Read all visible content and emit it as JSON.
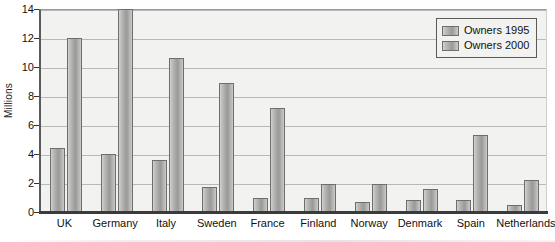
{
  "chart_data": {
    "type": "bar",
    "title": "",
    "xlabel": "",
    "ylabel": "Millions",
    "ylim": [
      0,
      14
    ],
    "yticks": [
      0,
      2,
      4,
      6,
      8,
      10,
      12,
      14
    ],
    "ytick_labels": [
      "0",
      "2",
      "4",
      "6",
      "8",
      "10",
      "12",
      "14"
    ],
    "grid": true,
    "legend_position": "top-right",
    "categories": [
      "UK",
      "Germany",
      "Italy",
      "Sweden",
      "France",
      "Finland",
      "Norway",
      "Denmark",
      "Spain",
      "Netherlands"
    ],
    "series": [
      {
        "name": "Owners 1995",
        "values": [
          4.4,
          4.0,
          3.6,
          1.7,
          1.0,
          1.0,
          0.7,
          0.8,
          0.8,
          0.5
        ]
      },
      {
        "name": "Owners 2000",
        "values": [
          12.0,
          14.0,
          10.6,
          8.9,
          7.2,
          1.9,
          1.9,
          1.6,
          5.3,
          2.2
        ]
      }
    ]
  },
  "legend": {
    "entries": [
      "Owners 1995",
      "Owners 2000"
    ]
  },
  "axis": {
    "y_title": "Millions"
  },
  "title_sliver": {
    "text": ""
  },
  "colors": {
    "bar_fill_light": "#d2d2d0",
    "bar_fill_dark": "#9a9a98",
    "bar_border": "#6e6e6e",
    "plot_background": "#f2f2f0",
    "gridline": "#b8b8b6",
    "axis_line": "#3b3b3b",
    "text": "#111111"
  }
}
